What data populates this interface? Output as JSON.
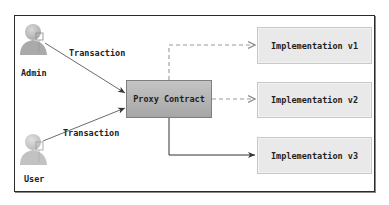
{
  "diagram": {
    "actors": [
      {
        "id": "admin",
        "label": "Admin",
        "icon": "user-icon"
      },
      {
        "id": "user",
        "label": "User",
        "icon": "user-icon"
      }
    ],
    "nodes": [
      {
        "id": "proxy",
        "label": "Proxy Contract",
        "style": "gradient-gray"
      },
      {
        "id": "impl1",
        "label": "Implementation v1",
        "style": "light-gray"
      },
      {
        "id": "impl2",
        "label": "Implementation v2",
        "style": "light-gray"
      },
      {
        "id": "impl3",
        "label": "Implementation v3",
        "style": "light-gray"
      }
    ],
    "edges": [
      {
        "from": "admin",
        "to": "proxy",
        "label": "Transaction",
        "line": "solid"
      },
      {
        "from": "user",
        "to": "proxy",
        "label": "Transaction",
        "line": "solid"
      },
      {
        "from": "proxy",
        "to": "impl1",
        "label": "",
        "line": "dashed"
      },
      {
        "from": "proxy",
        "to": "impl2",
        "label": "",
        "line": "dashed"
      },
      {
        "from": "proxy",
        "to": "impl3",
        "label": "",
        "line": "solid"
      }
    ],
    "colors": {
      "frame": "#2a2a2a",
      "proxy_fill_top": "#c4c4c4",
      "proxy_fill_bottom": "#a6a6a6",
      "impl_fill": "#e9e9e9",
      "solid_edge": "#333333",
      "dashed_edge": "#9a9a9a",
      "actor_fill": "#b8b8b8"
    }
  }
}
